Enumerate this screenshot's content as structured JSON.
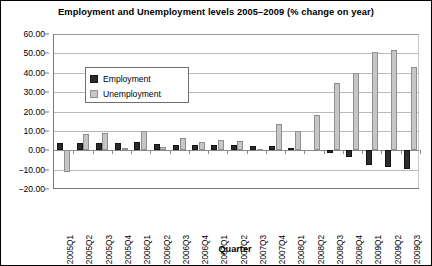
{
  "chart_data": {
    "type": "bar",
    "title": "Employment and Unemployment levels 2005–2009 (% change on year)",
    "xlabel": "Quarter",
    "ylabel": "",
    "ylim": [
      -20.0,
      60.0
    ],
    "ytick_step": 10.0,
    "ytick_labels": [
      "60.00",
      "50.00",
      "40.00",
      "30.00",
      "20.00",
      "10.00",
      "0.00",
      "-10.00",
      "-20.00"
    ],
    "ytick_values": [
      60.0,
      50.0,
      40.0,
      30.0,
      20.0,
      10.0,
      0.0,
      -10.0,
      -20.0
    ],
    "grid": true,
    "legend_position": "upper-left-inside",
    "categories": [
      "2005Q1",
      "2005Q2",
      "2005Q3",
      "2005Q4",
      "2006Q1",
      "2006Q2",
      "2006Q3",
      "2006Q4",
      "2007Q1",
      "2007Q2",
      "2007Q3",
      "2007Q4",
      "2008Q1",
      "2008Q2",
      "2008Q3",
      "2008Q4",
      "2009Q1",
      "2009Q2",
      "2009Q3"
    ],
    "series": [
      {
        "name": "Employment",
        "color": "#2b2b2b",
        "values": [
          4.0,
          3.8,
          3.9,
          4.0,
          4.2,
          3.4,
          2.8,
          2.6,
          2.7,
          2.8,
          2.4,
          2.2,
          1.2,
          0.0,
          -1.3,
          -3.7,
          -7.8,
          -8.6,
          -9.7
        ]
      },
      {
        "name": "Unemployment",
        "color": "#c6c6c6",
        "values": [
          -11.3,
          8.2,
          8.7,
          1.1,
          9.7,
          1.9,
          6.3,
          4.2,
          5.3,
          4.9,
          0.5,
          13.4,
          9.9,
          18.3,
          34.8,
          40.1,
          50.6,
          51.8,
          43.0
        ]
      }
    ]
  },
  "legend": {
    "items": [
      {
        "label": "Employment"
      },
      {
        "label": "Unemployment"
      }
    ]
  }
}
